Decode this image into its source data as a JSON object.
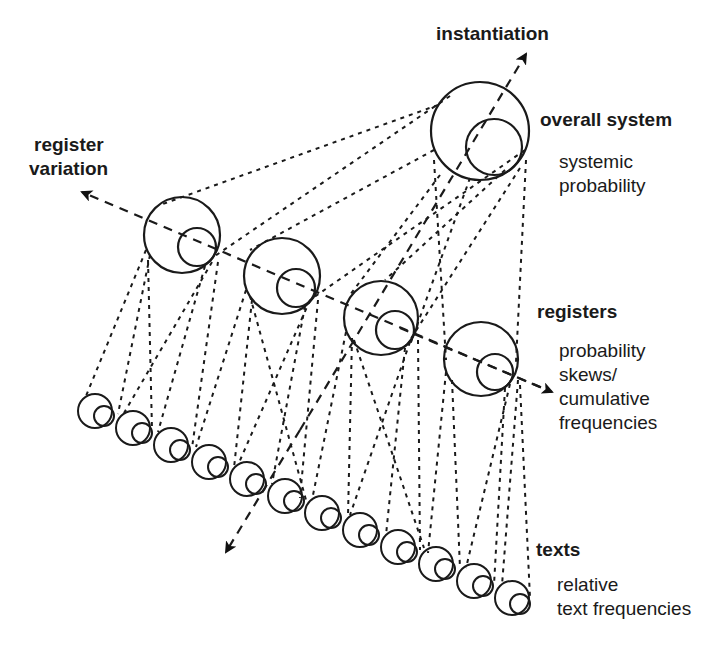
{
  "diagram": {
    "axes": {
      "instantiation": {
        "label": "instantiation"
      },
      "register_variation": {
        "label_line1": "register",
        "label_line2": "variation"
      }
    },
    "levels": {
      "overall_system": {
        "title": "overall system",
        "desc_line1": "systemic",
        "desc_line2": "probability"
      },
      "registers": {
        "title": "registers",
        "desc_line1": "probability",
        "desc_line2": "skews/",
        "desc_line3": "cumulative",
        "desc_line4": "frequencies"
      },
      "texts": {
        "title": "texts",
        "desc_line1": "relative",
        "desc_line2": "text frequencies"
      }
    },
    "counts": {
      "system_circles": 1,
      "register_circles": 4,
      "text_circles": 12
    },
    "colors": {
      "ink": "#1a1a1a",
      "background": "#ffffff"
    }
  }
}
